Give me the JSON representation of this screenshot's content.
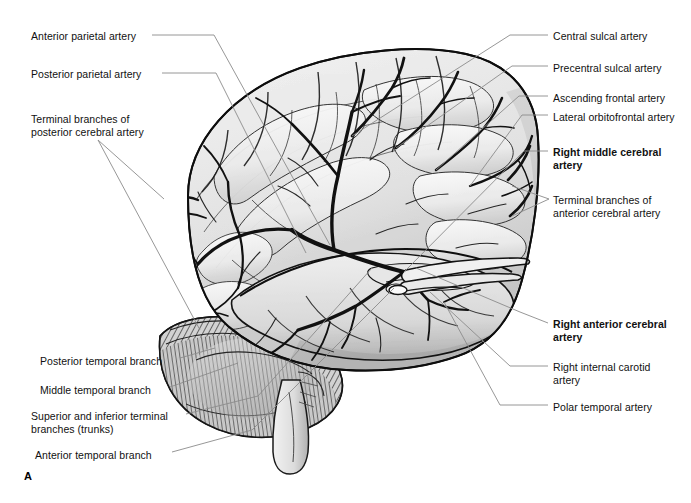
{
  "figure": {
    "panel_label": "A",
    "view": "lateral view of right cerebral hemisphere with arterial supply",
    "background_color": "#ffffff",
    "leader_line_color": "#8b8b8b",
    "artery_color": "#1a1a1a",
    "cortex_fill_light": "#ededed",
    "cortex_fill_mid": "#d6d6d6",
    "cortex_fill_dark": "#b4b4b4",
    "cerebellum_hatch_color": "#3a3a3a"
  },
  "labels_left": [
    {
      "id": "anterior-parietal-artery",
      "text": "Anterior parietal artery",
      "x": 31,
      "y": 30,
      "bold": false
    },
    {
      "id": "posterior-parietal-artery",
      "text": "Posterior parietal artery",
      "x": 31,
      "y": 68,
      "bold": false
    },
    {
      "id": "terminal-branches-posterior-cerebral-artery",
      "text": "Terminal branches of\nposterior cerebral artery",
      "x": 31,
      "y": 113,
      "bold": false
    },
    {
      "id": "posterior-temporal-branch",
      "text": "Posterior temporal branch",
      "x": 40,
      "y": 355,
      "bold": false
    },
    {
      "id": "middle-temporal-branch",
      "text": "Middle temporal branch",
      "x": 40,
      "y": 384,
      "bold": false
    },
    {
      "id": "superior-inferior-terminal-branches-trunks",
      "text": "Superior and inferior terminal\nbranches (trunks)",
      "x": 31,
      "y": 410,
      "bold": false
    },
    {
      "id": "anterior-temporal-branch",
      "text": "Anterior temporal branch",
      "x": 35,
      "y": 449,
      "bold": false
    }
  ],
  "labels_right": [
    {
      "id": "central-sulcal-artery",
      "text": "Central sulcal artery",
      "x": 553,
      "y": 30,
      "bold": false
    },
    {
      "id": "precentral-sulcal-artery",
      "text": "Precentral sulcal artery",
      "x": 553,
      "y": 62,
      "bold": false
    },
    {
      "id": "ascending-frontal-artery",
      "text": "Ascending frontal artery",
      "x": 553,
      "y": 92,
      "bold": false
    },
    {
      "id": "lateral-orbitofrontal-artery",
      "text": "Lateral orbitofrontal artery",
      "x": 553,
      "y": 111,
      "bold": false
    },
    {
      "id": "right-middle-cerebral-artery",
      "text": "Right middle cerebral\nartery",
      "x": 553,
      "y": 146,
      "bold": true
    },
    {
      "id": "terminal-branches-anterior-cerebral-artery",
      "text": "Terminal branches of\nanterior cerebral artery",
      "x": 553,
      "y": 194,
      "bold": false
    },
    {
      "id": "right-anterior-cerebral-artery",
      "text": "Right anterior cerebral\nartery",
      "x": 553,
      "y": 318,
      "bold": true
    },
    {
      "id": "right-internal-carotid-artery",
      "text": "Right internal carotid\nartery",
      "x": 553,
      "y": 361,
      "bold": false
    },
    {
      "id": "polar-temporal-artery",
      "text": "Polar temporal artery",
      "x": 553,
      "y": 401,
      "bold": false
    }
  ],
  "leaders": [
    {
      "id": "leader-anterior-parietal-artery",
      "d": "M152,35 L214,35 L330,245"
    },
    {
      "id": "leader-posterior-parietal-artery",
      "d": "M162,73 L216,73 L306,253"
    },
    {
      "id": "leader-terminal-posterior-cerebral-a",
      "d": "M98,140 L164,199"
    },
    {
      "id": "leader-terminal-posterior-cerebral-b",
      "d": "M98,140 L200,330"
    },
    {
      "id": "leader-posterior-temporal-branch",
      "d": "M180,358 L215,348"
    },
    {
      "id": "leader-middle-temporal-branch",
      "d": "M170,387 L238,363"
    },
    {
      "id": "leader-superior-inferior-terminal",
      "d": "M186,414 L258,396 L372,268"
    },
    {
      "id": "leader-anterior-temporal-branch",
      "d": "M172,452 L252,430 L394,288"
    },
    {
      "id": "leader-central-sulcal-artery",
      "d": "M548,35 L510,35 L352,136"
    },
    {
      "id": "leader-precentral-sulcal-artery",
      "d": "M548,66 L512,66 L396,148"
    },
    {
      "id": "leader-ascending-frontal-artery",
      "d": "M548,96 L519,96 L436,170"
    },
    {
      "id": "leader-lateral-orbitofrontal-artery",
      "d": "M548,115 L522,115 L470,186"
    },
    {
      "id": "leader-right-middle-cerebral-artery",
      "d": "M548,151 L524,151 L404,272"
    },
    {
      "id": "leader-terminal-anterior-cerebral-a",
      "d": "M549,199 L512,186"
    },
    {
      "id": "leader-terminal-anterior-cerebral-b",
      "d": "M549,199 L512,216"
    },
    {
      "id": "leader-right-anterior-cerebral-artery",
      "d": "M548,323 L520,312 L416,268"
    },
    {
      "id": "leader-right-internal-carotid-artery",
      "d": "M548,366 L510,366 L430,292"
    },
    {
      "id": "leader-polar-temporal-artery",
      "d": "M548,405 L500,405 L444,302"
    }
  ]
}
